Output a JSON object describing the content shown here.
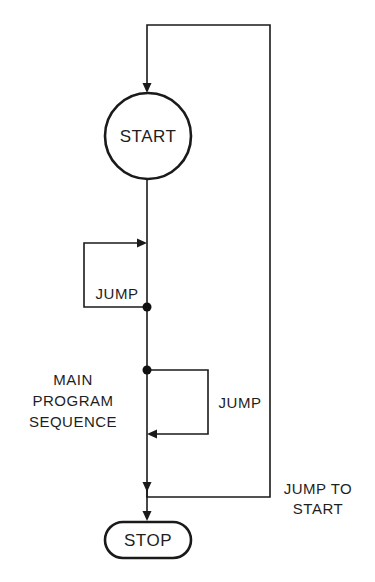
{
  "diagram": {
    "nodes": {
      "start": {
        "label": "START",
        "shape": "circle"
      },
      "stop": {
        "label": "STOP",
        "shape": "rounded-rectangle"
      }
    },
    "labels": {
      "jump_back": "JUMP",
      "jump_forward": "JUMP",
      "main_sequence": [
        "MAIN",
        "PROGRAM",
        "SEQUENCE"
      ],
      "jump_to_start": [
        "JUMP TO",
        "START"
      ]
    },
    "edges": [
      {
        "from": "start",
        "to": "stop",
        "label": "main program sequence"
      },
      {
        "from": "jump-point-1",
        "to": "earlier-point",
        "label": "JUMP",
        "direction": "backward"
      },
      {
        "from": "jump-point-2",
        "to": "later-point",
        "label": "JUMP",
        "direction": "forward"
      },
      {
        "from": "end-of-sequence",
        "to": "start",
        "label": "JUMP TO START"
      }
    ],
    "colors": {
      "line": "#1a1a1a",
      "background": "#ffffff"
    }
  }
}
